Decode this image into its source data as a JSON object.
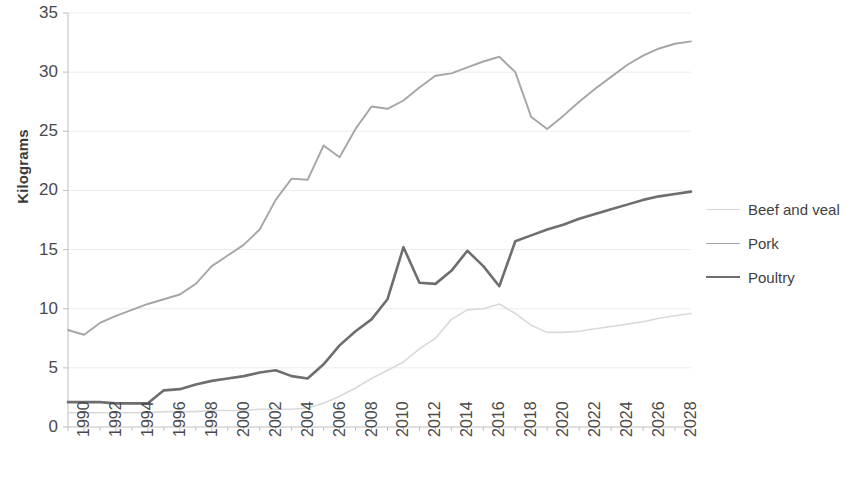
{
  "chart_data": {
    "type": "line",
    "title": "",
    "xlabel": "",
    "ylabel": "Kilograms",
    "ylim": [
      0,
      35
    ],
    "yticks": [
      0,
      5,
      10,
      15,
      20,
      25,
      30,
      35
    ],
    "xlim": [
      1990,
      2029
    ],
    "xticks": [
      1990,
      1992,
      1994,
      1996,
      1998,
      2000,
      2002,
      2004,
      2006,
      2008,
      2010,
      2012,
      2014,
      2016,
      2018,
      2020,
      2022,
      2024,
      2026,
      2028
    ],
    "grid": true,
    "legend_position": "right",
    "x": [
      1990,
      1991,
      1992,
      1993,
      1994,
      1995,
      1996,
      1997,
      1998,
      1999,
      2000,
      2001,
      2002,
      2003,
      2004,
      2005,
      2006,
      2007,
      2008,
      2009,
      2010,
      2011,
      2012,
      2013,
      2014,
      2015,
      2016,
      2017,
      2018,
      2019,
      2020,
      2021,
      2022,
      2023,
      2024,
      2025,
      2026,
      2027,
      2028,
      2029
    ],
    "series": [
      {
        "name": "Beef and veal",
        "color": "#d9d9d9",
        "width": 1.6,
        "values": [
          1.2,
          1.2,
          1.2,
          1.2,
          1.2,
          1.2,
          1.3,
          1.3,
          1.3,
          1.4,
          1.4,
          1.4,
          1.5,
          1.5,
          1.5,
          1.6,
          2.0,
          2.6,
          3.3,
          4.1,
          4.8,
          5.5,
          6.6,
          7.5,
          9.1,
          9.9,
          10.0,
          10.4,
          9.6,
          8.6,
          8.0,
          8.0,
          8.1,
          8.3,
          8.5,
          8.7,
          8.9,
          9.2,
          9.4,
          9.6
        ]
      },
      {
        "name": "Pork",
        "color": "#a6a6a6",
        "width": 1.9,
        "values": [
          8.2,
          7.8,
          8.8,
          9.4,
          9.9,
          10.4,
          10.8,
          11.2,
          12.1,
          13.6,
          14.5,
          15.4,
          16.7,
          19.2,
          21.0,
          20.9,
          23.8,
          22.8,
          25.2,
          27.1,
          26.9,
          27.6,
          28.7,
          29.7,
          29.9,
          30.4,
          30.9,
          31.3,
          30.0,
          26.2,
          25.2,
          26.3,
          27.5,
          28.6,
          29.6,
          30.6,
          31.4,
          32.0,
          32.4,
          32.6
        ]
      },
      {
        "name": "Poultry",
        "color": "#6e6e6e",
        "width": 2.6,
        "values": [
          2.1,
          2.1,
          2.1,
          2.0,
          2.0,
          2.0,
          3.1,
          3.2,
          3.6,
          3.9,
          4.1,
          4.3,
          4.6,
          4.8,
          4.3,
          4.1,
          5.3,
          6.9,
          8.1,
          9.1,
          10.8,
          15.2,
          12.2,
          12.1,
          13.2,
          14.9,
          13.6,
          11.9,
          15.7,
          16.2,
          16.7,
          17.1,
          17.6,
          18.0,
          18.4,
          18.8,
          19.2,
          19.5,
          19.7,
          19.9
        ]
      }
    ]
  },
  "legend": {
    "items": [
      {
        "label": "Beef and veal",
        "color": "#d9d9d9",
        "width": 1.6
      },
      {
        "label": "Pork",
        "color": "#a6a6a6",
        "width": 1.9
      },
      {
        "label": "Poultry",
        "color": "#6e6e6e",
        "width": 2.6
      }
    ]
  },
  "axis": {
    "y_title": "Kilograms",
    "axis_color": "#bfbfbf",
    "grid_color": "#ececec",
    "tick_text_color": "#4a4a4a"
  }
}
